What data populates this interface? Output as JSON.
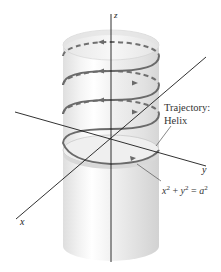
{
  "figure": {
    "axes": {
      "x_label": "x",
      "y_label": "y",
      "z_label": "z"
    },
    "annotations": {
      "trajectory_line1": "Trajectory:",
      "trajectory_line2": "Helix",
      "equation": {
        "x": "x",
        "plus": " + ",
        "y": "y",
        "eq": " = ",
        "a": "a",
        "exp": "2"
      }
    },
    "helix": {
      "turns": 3,
      "back_style": "dashed",
      "front_style": "solid",
      "color": "#6e6e6e"
    },
    "cylinder": {
      "fill_light": "#f4f4f4",
      "fill_dark": "#d6d6d6",
      "edge_color": "#c8c8c8"
    },
    "colors": {
      "axis": "#1a1a1a",
      "leader": "#555555",
      "text": "#222222"
    }
  }
}
